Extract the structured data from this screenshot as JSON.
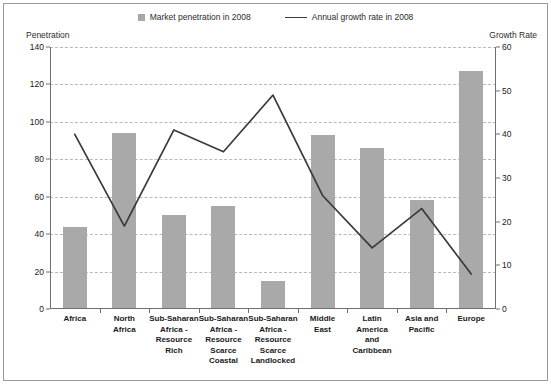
{
  "legend": {
    "bar_label": "Market penetration in 2008",
    "line_label": "Annual growth rate in 2008"
  },
  "axes": {
    "left_caption": "Penetration",
    "right_caption": "Growth Rate",
    "left_ticks": [
      "140",
      "120",
      "100",
      "80",
      "60",
      "40",
      "20",
      "0"
    ],
    "right_ticks": [
      "60",
      "50",
      "40",
      "30",
      "20",
      "10",
      "0"
    ]
  },
  "colors": {
    "bar": "#a9a9a9",
    "line": "#3a3a3a",
    "grid": "#b9b9b9",
    "axis": "#6f6f6f",
    "frame": "#9a9a9a",
    "text": "#1a1a1a"
  },
  "chart_data": {
    "type": "bar",
    "title": "",
    "xlabel": "",
    "ylabel": "Penetration",
    "y2label": "Growth Rate",
    "ylim": [
      0,
      140
    ],
    "y2lim": [
      0,
      60
    ],
    "grid": true,
    "legend_position": "top",
    "categories": [
      "Africa",
      "North Africa",
      "Sub-Saharan Africa - Resource Rich",
      "Sub-Saharan Africa - Resource Scarce Coastal",
      "Sub-Saharan Africa - Resource Scarce Landlocked",
      "Middle East",
      "Latin America and Caribbean",
      "Asia and Pacific",
      "Europe"
    ],
    "category_lines": [
      [
        "Africa"
      ],
      [
        "North",
        "Africa"
      ],
      [
        "Sub-Saharan",
        "Africa -",
        "Resource Rich"
      ],
      [
        "Sub-Saharan",
        "Africa -",
        "Resource",
        "Scarce",
        "Coastal"
      ],
      [
        "Sub-Saharan",
        "Africa -",
        "Resource",
        "Scarce",
        "Landlocked"
      ],
      [
        "Middle",
        "East"
      ],
      [
        "Latin America",
        "and Caribbean"
      ],
      [
        "Asia and",
        "Pacific"
      ],
      [
        "Europe"
      ]
    ],
    "series": [
      {
        "name": "Market penetration in 2008",
        "type": "bar",
        "axis": "left",
        "values": [
          44,
          94,
          50,
          55,
          15,
          93,
          86,
          58,
          127
        ]
      },
      {
        "name": "Annual growth rate in 2008",
        "type": "line",
        "axis": "right",
        "values": [
          40,
          19,
          41,
          36,
          49,
          26,
          14,
          23,
          8
        ]
      }
    ]
  }
}
